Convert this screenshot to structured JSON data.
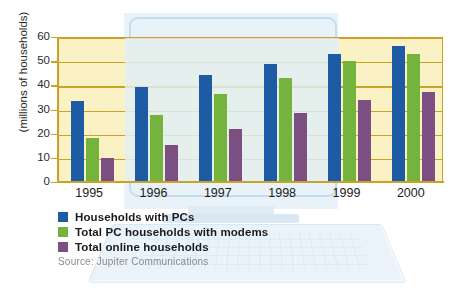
{
  "chart_data": {
    "type": "bar",
    "title": "",
    "xlabel": "",
    "ylabel": "(millions of households)",
    "ylim": [
      0,
      60
    ],
    "yticks": [
      0,
      10,
      20,
      30,
      40,
      50,
      60
    ],
    "grid": true,
    "legend_position": "below-left",
    "categories": [
      "1995",
      "1996",
      "1997",
      "1998",
      "1999",
      "2000"
    ],
    "series": [
      {
        "name": "Households with PCs",
        "color": "#1d5ca4",
        "values": [
          33,
          39,
          44,
          48.5,
          52.5,
          56
        ]
      },
      {
        "name": "Total PC households with modems",
        "color": "#74b43c",
        "values": [
          18,
          27.5,
          36,
          42.5,
          49.5,
          52.5
        ]
      },
      {
        "name": "Total online households",
        "color": "#7b4f82",
        "values": [
          9.5,
          15,
          21.5,
          28,
          33.5,
          37
        ]
      }
    ],
    "source": "Source: Jupiter Communications",
    "colors": {
      "plot_background": "#faf2c4",
      "grid_and_axis": "#c9a227",
      "watermark": "#e2eef7",
      "page_background": "#ffffff"
    }
  }
}
